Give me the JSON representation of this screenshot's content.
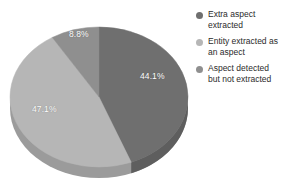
{
  "chart_data": {
    "type": "pie",
    "title": "",
    "subtitle": "",
    "xlabel": "",
    "ylabel": "",
    "grid": false,
    "legend_position": "right",
    "three_d": true,
    "start_angle_deg": 0,
    "direction": "clockwise",
    "categories": [
      "Extra aspect extracted",
      "Entity extracted as an aspect",
      "Aspect detected but not extracted"
    ],
    "values": [
      44.1,
      47.1,
      8.8
    ],
    "value_labels": [
      "44.1%",
      "47.1%",
      "8.8%"
    ],
    "colors": [
      "#6f6f6f",
      "#b6b6b6",
      "#8f8f8f"
    ],
    "side_colors": [
      "#5e5e5e",
      "#9b9b9b",
      "#7c7c7c"
    ],
    "label_color": "#ffffff",
    "background": "#ffffff"
  },
  "legend": {
    "items": [
      {
        "label_line1": "Extra aspect",
        "label_line2": "extracted",
        "color": "#6f6f6f"
      },
      {
        "label_line1": "Entity extracted as",
        "label_line2": "an aspect",
        "color": "#b6b6b6"
      },
      {
        "label_line1": "Aspect detected",
        "label_line2": "but not extracted",
        "color": "#8f8f8f"
      }
    ]
  }
}
